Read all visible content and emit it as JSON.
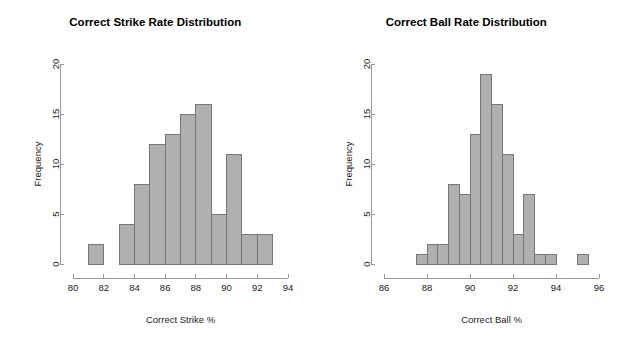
{
  "page": {
    "background_color": "#ffffff",
    "bar_fill_color": "#b0b0b0",
    "bar_border_color": "#777777",
    "axis_color": "#999999",
    "text_color": "#1a1a1a"
  },
  "panels": [
    {
      "name": "correct-strike-rate",
      "title": "Correct Strike Rate Distribution",
      "xlabel": "Correct Strike %",
      "ylabel": "Frequency"
    },
    {
      "name": "correct-ball-rate",
      "title": "Correct Ball Rate Distribution",
      "xlabel": "Correct Ball %",
      "ylabel": "Frequency"
    }
  ],
  "chart_data": [
    {
      "type": "bar",
      "subtype": "histogram",
      "name": "correct-strike-rate",
      "title": "Correct Strike Rate Distribution",
      "xlabel": "Correct Strike %",
      "ylabel": "Frequency",
      "xlim": [
        80,
        94
      ],
      "ylim": [
        0,
        20
      ],
      "xticks": [
        80,
        82,
        84,
        86,
        88,
        90,
        92,
        94
      ],
      "yticks": [
        0,
        5,
        10,
        15,
        20
      ],
      "xtick_labels": [
        "80",
        "82",
        "84",
        "86",
        "88",
        "90",
        "92",
        "94"
      ],
      "ytick_labels": [
        "0",
        "5",
        "10",
        "15",
        "20"
      ],
      "grid": false,
      "legend": false,
      "bin_width": 1,
      "bins": [
        {
          "left": 81,
          "right": 82,
          "value": 2
        },
        {
          "left": 82,
          "right": 83,
          "value": 0
        },
        {
          "left": 83,
          "right": 84,
          "value": 4
        },
        {
          "left": 84,
          "right": 85,
          "value": 8
        },
        {
          "left": 85,
          "right": 86,
          "value": 12
        },
        {
          "left": 86,
          "right": 87,
          "value": 13
        },
        {
          "left": 87,
          "right": 88,
          "value": 15
        },
        {
          "left": 88,
          "right": 89,
          "value": 16
        },
        {
          "left": 89,
          "right": 90,
          "value": 5
        },
        {
          "left": 90,
          "right": 91,
          "value": 11
        },
        {
          "left": 91,
          "right": 92,
          "value": 3
        },
        {
          "left": 92,
          "right": 93,
          "value": 3
        }
      ]
    },
    {
      "type": "bar",
      "subtype": "histogram",
      "name": "correct-ball-rate",
      "title": "Correct Ball Rate Distribution",
      "xlabel": "Correct Ball %",
      "ylabel": "Frequency",
      "xlim": [
        86,
        96
      ],
      "ylim": [
        0,
        20
      ],
      "xticks": [
        86,
        88,
        90,
        92,
        94,
        96
      ],
      "yticks": [
        0,
        5,
        10,
        15,
        20
      ],
      "xtick_labels": [
        "86",
        "88",
        "90",
        "92",
        "94",
        "96"
      ],
      "ytick_labels": [
        "0",
        "5",
        "10",
        "15",
        "20"
      ],
      "grid": false,
      "legend": false,
      "bin_width": 0.5,
      "bins": [
        {
          "left": 87.5,
          "right": 88.0,
          "value": 1
        },
        {
          "left": 88.0,
          "right": 88.5,
          "value": 2
        },
        {
          "left": 88.5,
          "right": 89.0,
          "value": 2
        },
        {
          "left": 89.0,
          "right": 89.5,
          "value": 8
        },
        {
          "left": 89.5,
          "right": 90.0,
          "value": 7
        },
        {
          "left": 90.0,
          "right": 90.5,
          "value": 13
        },
        {
          "left": 90.5,
          "right": 91.0,
          "value": 19
        },
        {
          "left": 91.0,
          "right": 91.5,
          "value": 16
        },
        {
          "left": 91.5,
          "right": 92.0,
          "value": 11
        },
        {
          "left": 92.0,
          "right": 92.5,
          "value": 3
        },
        {
          "left": 92.5,
          "right": 93.0,
          "value": 7
        },
        {
          "left": 93.0,
          "right": 93.5,
          "value": 1
        },
        {
          "left": 93.5,
          "right": 94.0,
          "value": 1
        },
        {
          "left": 94.0,
          "right": 94.5,
          "value": 0
        },
        {
          "left": 94.5,
          "right": 95.0,
          "value": 0
        },
        {
          "left": 95.0,
          "right": 95.5,
          "value": 1
        }
      ]
    }
  ]
}
